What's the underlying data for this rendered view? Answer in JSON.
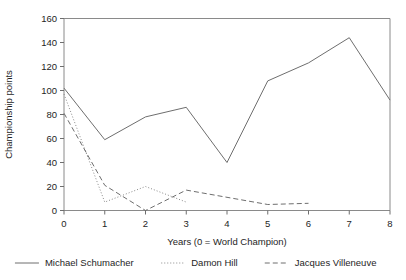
{
  "chart_data": {
    "type": "line",
    "title": "",
    "xlabel": "Years (0 = World Champion)",
    "ylabel": "Championship points",
    "x": [
      0,
      1,
      2,
      3,
      4,
      5,
      6,
      7,
      8
    ],
    "xlim": [
      0,
      8
    ],
    "ylim": [
      0,
      160
    ],
    "xticks": [
      "0",
      "1",
      "2",
      "3",
      "4",
      "5",
      "6",
      "7",
      "8"
    ],
    "yticks": [
      "0",
      "20",
      "40",
      "60",
      "80",
      "100",
      "120",
      "140",
      "160"
    ],
    "grid": false,
    "legend_position": "bottom",
    "series": [
      {
        "name": "Michael Schumacher",
        "style": "solid",
        "color": "#6e6e6e",
        "x": [
          0,
          1,
          2,
          3,
          4,
          5,
          6,
          7,
          8
        ],
        "values": [
          102,
          59,
          78,
          86,
          40,
          108,
          123,
          144,
          92
        ]
      },
      {
        "name": "Damon Hill",
        "style": "dotted",
        "color": "#8a8a8a",
        "x": [
          0,
          1,
          2,
          3
        ],
        "values": [
          97,
          7,
          20,
          7
        ]
      },
      {
        "name": "Jacques Villeneuve",
        "style": "dashed",
        "color": "#6e6e6e",
        "x": [
          0,
          1,
          2,
          3,
          4,
          5,
          6
        ],
        "values": [
          81,
          21,
          0,
          17,
          11,
          5,
          6
        ]
      }
    ]
  },
  "legend": {
    "items": [
      {
        "label": "Michael Schumacher"
      },
      {
        "label": "Damon Hill"
      },
      {
        "label": "Jacques Villeneuve"
      }
    ]
  }
}
